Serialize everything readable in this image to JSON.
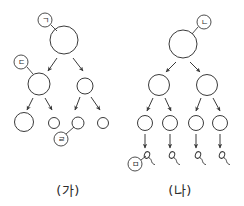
{
  "figure": {
    "title": "",
    "background_color": "#ffffff",
    "stroke_color": "#3a3a3a",
    "width": 244,
    "height": 206
  },
  "panels": [
    {
      "id": "panel-ga",
      "caption": "(가)",
      "caption_x": 68,
      "caption_y": 190,
      "rows": [
        {
          "row_index": 0,
          "cells": [
            {
              "cx": 64,
              "cy": 40,
              "r": 14
            }
          ]
        },
        {
          "row_index": 1,
          "cells": [
            {
              "cx": 39,
              "cy": 84,
              "r": 11
            },
            {
              "cx": 85,
              "cy": 86,
              "r": 8
            }
          ]
        },
        {
          "row_index": 2,
          "cells": [
            {
              "cx": 24,
              "cy": 122,
              "r": 9.5
            },
            {
              "cx": 54,
              "cy": 123,
              "r": 5.5
            },
            {
              "cx": 78,
              "cy": 123,
              "r": 6
            },
            {
              "cx": 103,
              "cy": 123,
              "r": 5.5
            }
          ]
        }
      ],
      "arrows": [
        {
          "x1": 57,
          "y1": 58,
          "x2": 48,
          "y2": 71
        },
        {
          "x1": 73,
          "y1": 58,
          "x2": 83,
          "y2": 71
        },
        {
          "x1": 33,
          "y1": 98,
          "x2": 27,
          "y2": 110
        },
        {
          "x1": 45,
          "y1": 98,
          "x2": 52,
          "y2": 110
        },
        {
          "x1": 80,
          "y1": 97,
          "x2": 75,
          "y2": 110
        },
        {
          "x1": 91,
          "y1": 97,
          "x2": 100,
          "y2": 110
        }
      ],
      "tags": [
        {
          "id": "tag-giyeok",
          "name": "label-giyeok",
          "text": "ㄱ",
          "cx": 45,
          "cy": 20,
          "r": 7,
          "leader": {
            "x1": 51,
            "y1": 25,
            "x2": 57,
            "y2": 31
          }
        },
        {
          "id": "tag-digeut",
          "name": "label-digeut",
          "text": "ㄷ",
          "cx": 21,
          "cy": 62,
          "r": 7,
          "leader": {
            "x1": 27,
            "y1": 67,
            "x2": 33,
            "y2": 74
          }
        },
        {
          "id": "tag-rieul",
          "name": "label-rieul",
          "text": "ㄹ",
          "cx": 61,
          "cy": 139,
          "r": 7,
          "leader": {
            "x1": 66,
            "y1": 134,
            "x2": 74,
            "y2": 127
          }
        }
      ],
      "gametes": []
    },
    {
      "id": "panel-na",
      "caption": "(나)",
      "caption_x": 180,
      "caption_y": 190,
      "rows": [
        {
          "row_index": 0,
          "cells": [
            {
              "cx": 183,
              "cy": 44,
              "r": 14
            }
          ]
        },
        {
          "row_index": 1,
          "cells": [
            {
              "cx": 159,
              "cy": 85,
              "r": 10.5
            },
            {
              "cx": 207,
              "cy": 85,
              "r": 10.5
            }
          ]
        },
        {
          "row_index": 2,
          "cells": [
            {
              "cx": 145,
              "cy": 123,
              "r": 7.5
            },
            {
              "cx": 170,
              "cy": 123,
              "r": 7.5
            },
            {
              "cx": 196,
              "cy": 123,
              "r": 7.5
            },
            {
              "cx": 220,
              "cy": 123,
              "r": 7.5
            }
          ]
        }
      ],
      "arrows": [
        {
          "x1": 176,
          "y1": 62,
          "x2": 166,
          "y2": 72
        },
        {
          "x1": 190,
          "y1": 62,
          "x2": 200,
          "y2": 72
        },
        {
          "x1": 153,
          "y1": 98,
          "x2": 147,
          "y2": 111
        },
        {
          "x1": 165,
          "y1": 98,
          "x2": 171,
          "y2": 111
        },
        {
          "x1": 201,
          "y1": 98,
          "x2": 196,
          "y2": 111
        },
        {
          "x1": 213,
          "y1": 98,
          "x2": 220,
          "y2": 111
        },
        {
          "x1": 145,
          "y1": 134,
          "x2": 145,
          "y2": 148
        },
        {
          "x1": 170,
          "y1": 134,
          "x2": 170,
          "y2": 148
        },
        {
          "x1": 196,
          "y1": 134,
          "x2": 196,
          "y2": 148
        },
        {
          "x1": 220,
          "y1": 134,
          "x2": 220,
          "y2": 148
        }
      ],
      "tags": [
        {
          "id": "tag-nieun",
          "name": "label-nieun",
          "text": "ㄴ",
          "cx": 204,
          "cy": 22,
          "r": 7,
          "leader": {
            "x1": 198,
            "y1": 27,
            "x2": 192,
            "y2": 34
          }
        },
        {
          "id": "tag-mieum",
          "name": "label-mieum",
          "text": "ㅁ",
          "cx": 135,
          "cy": 164,
          "r": 7,
          "leader": {
            "x1": 141,
            "y1": 160,
            "x2": 146,
            "y2": 156
          }
        }
      ],
      "gametes": [
        {
          "hx": 147,
          "hy": 155
        },
        {
          "hx": 172,
          "hy": 155
        },
        {
          "hx": 198,
          "hy": 155
        },
        {
          "hx": 222,
          "hy": 155
        }
      ]
    }
  ]
}
